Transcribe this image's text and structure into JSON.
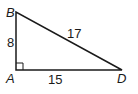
{
  "diagram": {
    "type": "right-triangle",
    "vertices": {
      "B": {
        "label": "B"
      },
      "A": {
        "label": "A"
      },
      "D": {
        "label": "D"
      }
    },
    "sides": {
      "AB": {
        "label": "8"
      },
      "AD": {
        "label": "15"
      },
      "BD": {
        "label": "17"
      }
    },
    "right_angle_at": "A",
    "colors": {
      "stroke": "#1a1a1a",
      "background": "#ffffff"
    }
  }
}
